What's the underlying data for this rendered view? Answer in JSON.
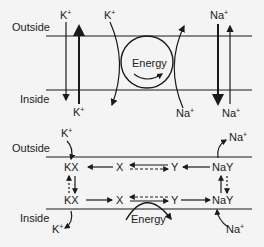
{
  "top_panel": {
    "outside_label": "Outside",
    "inside_label": "Inside",
    "k_left_top": "K",
    "k_left_bottom": "K",
    "k_channel_top": "K",
    "na_channel_bottom": "Na",
    "na_right_top": "Na",
    "na_right_bottom": "Na",
    "energy_label": "Energy",
    "plus": "+"
  },
  "bottom_panel": {
    "outside_label": "Outside",
    "inside_label": "Inside",
    "k_top": "K",
    "k_bottom": "K",
    "na_top": "Na",
    "na_bottom": "Na",
    "kx_top": "KX",
    "kx_bottom": "KX",
    "x_top": "X",
    "x_bottom": "X",
    "y_top": "Y",
    "y_bottom": "Y",
    "nay_top": "NaY",
    "nay_bottom": "NaY",
    "energy_label": "Energy",
    "plus": "+"
  },
  "colors": {
    "stroke": "#1a1a1a",
    "background": "#f4f4f4"
  }
}
